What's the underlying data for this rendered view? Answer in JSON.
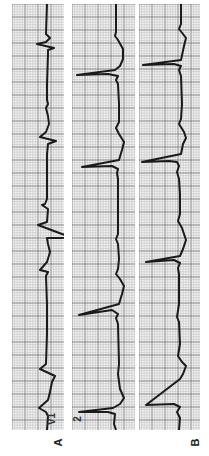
{
  "figure": {
    "panel_labels": {
      "a": "A",
      "b": "B"
    },
    "lead_labels": {
      "v1": "V1",
      "lead2": "2"
    },
    "colors": {
      "grid_minor": "#b8b8b8",
      "grid_major": "#7a7a7a",
      "paper": "#f4f4f4",
      "trace": "#1a1a1a"
    },
    "strips": [
      {
        "name": "strip-a-v1",
        "x": 12,
        "width": 52,
        "trace": "35,0 34,30 38,34 34,38 25,40 42,44 36,46 36,50 35,80 35,96 36,100 34,104 36,112 37,120 34,128 28,133 44,137 36,140 35,150 35,170 35,195 33,200 30,201 36,205 35,218 26,221 50,230 60,233 50,234 35,234 36,240 38,248 35,258 28,266 36,268 34,272 35,300 35,330 34,360 28,365 43,372 40,378 38,388 36,396 27,404 34,408 36,412 35,426"
      },
      {
        "name": "strip-2-lead2",
        "x": 72,
        "width": 63,
        "trace": "44,0 44,28 43,32 46,36 51,45 51,55 48,62 43,66 5,71 36,70 46,72 44,76 46,80 47,100 47,118 44,124 47,130 52,138 50,146 47,156 10,163 40,162 46,165 45,169 46,175 46,200 46,230 44,235 46,240 47,255 46,265 44,270 48,275 52,282 50,290 47,300 7,311 40,306 46,310 44,314 46,320 47,360 46,370 48,385 52,394 48,400 41,404 7,408 36,408 43,410 42,420 44,426"
      },
      {
        "name": "strip-b",
        "x": 139,
        "width": 61,
        "trace": "42,0 42,20 40,25 44,30 47,34 45,42 42,56 4,61 35,60 42,62 40,66 42,72 43,100 42,115 40,120 45,128 47,134 44,140 42,150 3,158 30,157 38,158 40,162 38,168 40,175 41,190 41,210 39,217 43,224 47,236 44,245 41,252 7,258 35,256 41,259 39,264 40,270 40,300 38,313 40,318 41,340 39,352 43,358 47,362 44,370 41,375 7,401 35,400 41,403 38,408 41,414 40,426"
      }
    ]
  }
}
